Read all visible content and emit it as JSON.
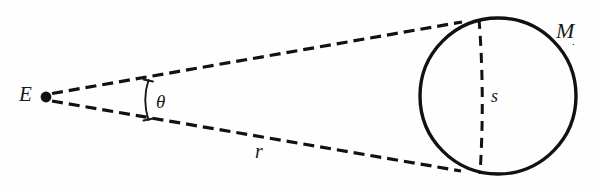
{
  "figure": {
    "kind": "geometry-diagram",
    "background_color": "#fefefe",
    "stroke_color": "#111111",
    "labels": {
      "observer": "E",
      "angle": "θ",
      "distance": "r",
      "size": "s",
      "body": "M",
      "body_subscript": "."
    },
    "geometry": {
      "vertex_point": {
        "x": 46,
        "y": 97,
        "radius": 5
      },
      "circle": {
        "cx": 498,
        "cy": 96,
        "r": 78,
        "stroke_width": 3.4
      },
      "tangent_upper": {
        "x1": 52,
        "y1": 93,
        "x2": 462,
        "y2": 22
      },
      "tangent_lower": {
        "x1": 52,
        "y1": 101,
        "x2": 461,
        "y2": 171
      },
      "chord": {
        "x1": 479,
        "y1": 19,
        "xm": 483,
        "ym": 97,
        "x2": 480,
        "y2": 174
      },
      "angle_arc": {
        "x_top": 148,
        "y_top": 80,
        "x_mid": 143,
        "y_mid": 100,
        "x_bot": 148,
        "y_bot": 120
      },
      "dash_pattern": "11 6",
      "stroke_width_dashed": 3.2
    }
  }
}
